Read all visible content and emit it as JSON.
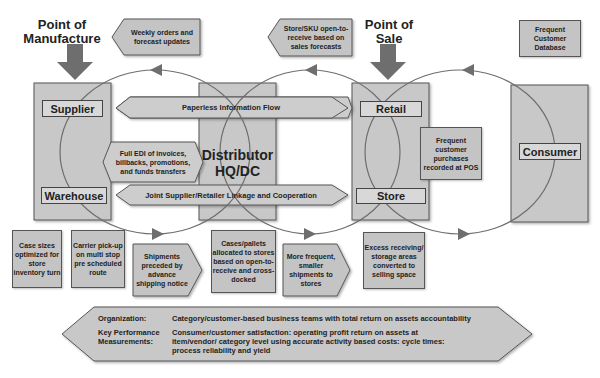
{
  "headings": {
    "point_of_manufacture": "Point of Manufacture",
    "point_of_sale": "Point of Sale"
  },
  "callouts": {
    "weekly_orders": "Weekly orders and forecast updates",
    "store_sku": "Store/SKU open-to-receive based on sales forecasts",
    "frequent_customer_db": "Frequent Customer Database",
    "frequent_purchases": "Frequent customer purchases recorded at POS"
  },
  "nodes": {
    "supplier": "Supplier",
    "warehouse": "Warehouse",
    "distributor": "Distributor HQ/DC",
    "retail": "Retail",
    "store": "Store",
    "consumer": "Consumer"
  },
  "flows": {
    "paperless": "Paperless Information Flow",
    "edi": "Full EDI of invoices, billbacks, promotions, and funds transfers",
    "joint": "Joint Supplier/Retailer Linkage and Cooperation"
  },
  "bottom_boxes": [
    "Case sizes optimized for store inventory turn",
    "Carrier pick-up on multi stop pre scheduled route",
    "Shipments preceded by advance shipping notice",
    "Cases/pallets allocated to stores based on open-to-receive and cross-docked",
    "More frequent, smaller shipments to stores",
    "Excess receiving/ storage areas converted to selling space"
  ],
  "summary": {
    "organization_label": "Organization:",
    "organization_text": "Category/customer-based business teams with total return on assets accountability",
    "kpm_label": "Key Performance Measurements:",
    "kpm_text": "Consumer/customer satisfaction: operating profit return on assets at item/vendor/ category level using accurate activity based costs: cycle times: process reliability and yield"
  },
  "colors": {
    "box_fill": "#c8c8c8",
    "label_fill": "#d8d8d8",
    "stroke": "#555555",
    "arrow": "#6e6e6e"
  }
}
